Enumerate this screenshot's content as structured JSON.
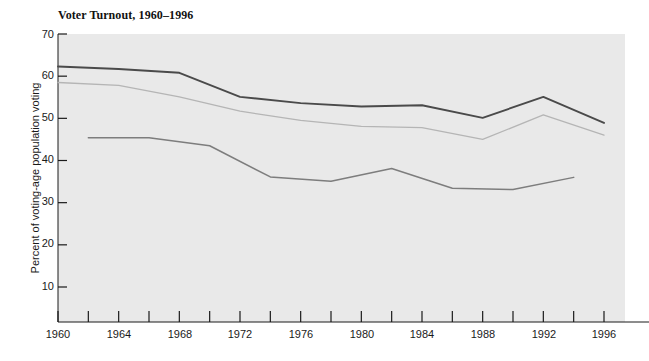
{
  "chart_data": {
    "type": "line",
    "title": "Voter Turnout, 1960–1996",
    "xlabel": "",
    "ylabel": "Percent of voting-age population voting",
    "xlim": [
      1960,
      1996
    ],
    "ylim": [
      0,
      70
    ],
    "grid": false,
    "legend_position": "inline-annotations",
    "y_ticks": [
      70,
      60,
      50,
      40,
      30,
      20,
      10
    ],
    "x_ticks": [
      1960,
      1962,
      1964,
      1966,
      1968,
      1970,
      1972,
      1974,
      1976,
      1978,
      1980,
      1982,
      1984,
      1986,
      1988,
      1990,
      1992,
      1994,
      1996
    ],
    "x_tick_labels": [
      1960,
      1964,
      1968,
      1972,
      1976,
      1980,
      1984,
      1988,
      1992,
      1996
    ],
    "series": [
      {
        "name": "For President",
        "color": "#4a4a4a",
        "x": [
          1960,
          1964,
          1968,
          1972,
          1976,
          1980,
          1984,
          1988,
          1992,
          1996
        ],
        "values": [
          62.3,
          61.7,
          60.8,
          55.1,
          53.6,
          52.8,
          53.1,
          50.1,
          55.1,
          48.9
        ]
      },
      {
        "name": "House, Presidential Year",
        "color": "#b0b0b0",
        "x": [
          1960,
          1964,
          1968,
          1972,
          1976,
          1980,
          1984,
          1988,
          1992,
          1996
        ],
        "values": [
          58.5,
          57.8,
          55.1,
          51.7,
          49.5,
          48.1,
          47.8,
          45.0,
          50.8,
          46.0
        ]
      },
      {
        "name": "House, Off-year",
        "color": "#7a7a7a",
        "x": [
          1962,
          1966,
          1970,
          1974,
          1978,
          1982,
          1986,
          1990,
          1994
        ],
        "values": [
          45.4,
          45.4,
          43.5,
          36.1,
          35.1,
          38.1,
          33.4,
          33.1,
          36.0
        ]
      }
    ],
    "annotations": [
      {
        "text": "For President",
        "x": 1978,
        "y": 55.0
      },
      {
        "text": "House, Presidential Year",
        "x": 1977,
        "y": 44.3
      },
      {
        "text": "House, Off–year",
        "x": 1975,
        "y": 31.9
      }
    ]
  },
  "axis": {
    "y_ticks": [
      {
        "label": "70",
        "top": 28
      },
      {
        "label": "60",
        "top": 69
      },
      {
        "label": "50",
        "top": 111
      },
      {
        "label": "40",
        "top": 153
      },
      {
        "label": "30",
        "top": 195
      },
      {
        "label": "20",
        "top": 237
      },
      {
        "label": "10",
        "top": 280
      }
    ],
    "x_labels": [
      {
        "label": "1960",
        "left": 35
      },
      {
        "label": "1964",
        "left": 96
      },
      {
        "label": "1968",
        "left": 157
      },
      {
        "label": "1972",
        "left": 217
      },
      {
        "label": "1976",
        "left": 278
      },
      {
        "label": "1980",
        "left": 339
      },
      {
        "label": "1984",
        "left": 399
      },
      {
        "label": "1988",
        "left": 460
      },
      {
        "label": "1992",
        "left": 521
      },
      {
        "label": "1996",
        "left": 581
      }
    ]
  },
  "annotations": {
    "for_president": {
      "text": "For President",
      "left": 262,
      "top": 83
    },
    "house_presidential": {
      "text": "House, Presidential Year",
      "left": 238,
      "top": 128
    },
    "house_offyear": {
      "text": "House, Off–year",
      "left": 232,
      "top": 180
    }
  },
  "colors": {
    "plot_background": "#e9e9e9",
    "axis": "#1a1a1a",
    "for_president": "#4a4a4a",
    "house_presidential": "#b5b5b5",
    "house_offyear": "#7d7d7d",
    "page_background": "#ffffff"
  }
}
